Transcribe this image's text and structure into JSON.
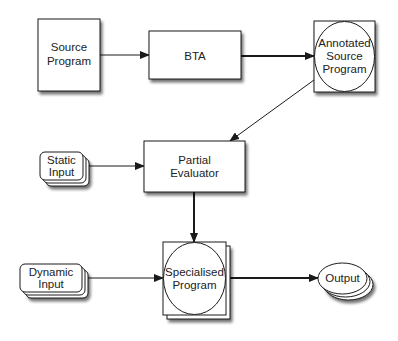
{
  "diagram": {
    "type": "flowchart",
    "colors": {
      "stroke": "#1a1a1a",
      "fill": "#ffffff",
      "shadow": "#8a8a8a",
      "text": "#222222"
    },
    "nodes": {
      "source_program": {
        "line1": "Source",
        "line2": "Program"
      },
      "bta": {
        "label": "BTA"
      },
      "annotated_source_program": {
        "line1": "Annotated",
        "line2": "Source",
        "line3": "Program"
      },
      "static_input": {
        "line1": "Static",
        "line2": "Input"
      },
      "partial_evaluator": {
        "line1": "Partial",
        "line2": "Evaluator"
      },
      "dynamic_input": {
        "line1": "Dynamic",
        "line2": "Input"
      },
      "specialised_program": {
        "line1": "Specialised",
        "line2": "Program"
      },
      "output": {
        "label": "Output"
      }
    },
    "edges": [
      {
        "from": "Source Program",
        "to": "BTA"
      },
      {
        "from": "BTA",
        "to": "Annotated Source Program"
      },
      {
        "from": "Annotated Source Program",
        "to": "Partial Evaluator"
      },
      {
        "from": "Static Input",
        "to": "Partial Evaluator"
      },
      {
        "from": "Partial Evaluator",
        "to": "Specialised Program"
      },
      {
        "from": "Dynamic Input",
        "to": "Specialised Program"
      },
      {
        "from": "Specialised Program",
        "to": "Output"
      }
    ]
  }
}
